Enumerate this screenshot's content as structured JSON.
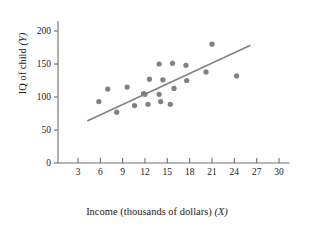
{
  "chart_data": {
    "type": "scatter",
    "title": "",
    "xlabel": "Income (thousands of dollars) (X)",
    "ylabel": "IQ of child (Y)",
    "xlabel_text": "Income (thousands of dollars) ",
    "xlabel_var": "(X)",
    "ylabel_text": "IQ of child ",
    "ylabel_var": "(Y)",
    "xlim": [
      0,
      31.5
    ],
    "ylim": [
      0,
      215
    ],
    "xticks": [
      3,
      6,
      9,
      12,
      15,
      18,
      21,
      24,
      27,
      30
    ],
    "yticks": [
      0,
      50,
      100,
      150,
      200
    ],
    "grid": false,
    "legend": false,
    "point_color": "#808080",
    "line_color": "#808080",
    "axis_color": "#6e6e6e",
    "points": [
      {
        "x": 5.8,
        "y": 93
      },
      {
        "x": 7.0,
        "y": 112
      },
      {
        "x": 8.2,
        "y": 77
      },
      {
        "x": 9.6,
        "y": 115
      },
      {
        "x": 10.6,
        "y": 87
      },
      {
        "x": 11.8,
        "y": 105
      },
      {
        "x": 12.0,
        "y": 104
      },
      {
        "x": 12.4,
        "y": 89
      },
      {
        "x": 12.6,
        "y": 127
      },
      {
        "x": 13.9,
        "y": 150
      },
      {
        "x": 13.9,
        "y": 104
      },
      {
        "x": 14.1,
        "y": 93
      },
      {
        "x": 14.4,
        "y": 126
      },
      {
        "x": 15.4,
        "y": 89
      },
      {
        "x": 15.7,
        "y": 151
      },
      {
        "x": 15.9,
        "y": 113
      },
      {
        "x": 17.5,
        "y": 148
      },
      {
        "x": 17.6,
        "y": 125
      },
      {
        "x": 20.2,
        "y": 138
      },
      {
        "x": 21.0,
        "y": 180
      },
      {
        "x": 24.3,
        "y": 132
      }
    ],
    "trendline": {
      "x1": 4.3,
      "y1": 64,
      "x2": 26.1,
      "y2": 178
    }
  }
}
